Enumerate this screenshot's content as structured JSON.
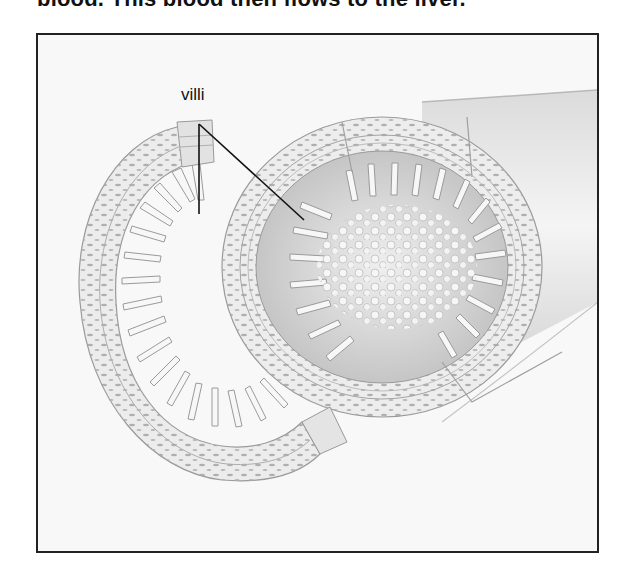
{
  "document": {
    "top_text": "blood. This blood then flows to the liver."
  },
  "figure": {
    "labels": [
      {
        "text": "villi",
        "pointer_count": 2
      }
    ],
    "colors": {
      "frame": "#222222",
      "background": "#f8f8f8",
      "tissue_line": "#9a9a9a",
      "tissue_fill": "#e6e6e6",
      "leader_line": "#111111"
    }
  }
}
